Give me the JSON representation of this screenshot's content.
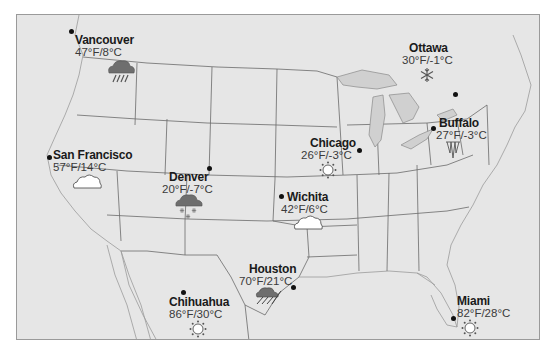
{
  "map": {
    "type": "weather-map",
    "region": "United States",
    "colors": {
      "land": "#e6e6e6",
      "water": "#d0d0d0",
      "border": "#6a6a6a",
      "text": "#1a1a1a",
      "temp_text": "#3a3a3a",
      "cloud_dark": "#6e6e6e",
      "cloud_light": "#ffffff"
    }
  },
  "cities": [
    {
      "name": "Vancouver",
      "temp": "47°F/8°C",
      "icon": "rain-cloud-icon",
      "condition": "rain"
    },
    {
      "name": "Ottawa",
      "temp": "30°F/-1°C",
      "icon": "snowflake-icon",
      "condition": "snow"
    },
    {
      "name": "Buffalo",
      "temp": "27°F/-3°C",
      "icon": "icicles-icon",
      "condition": "freezing"
    },
    {
      "name": "San Francisco",
      "temp": "57°F/14°C",
      "icon": "cloud-icon",
      "condition": "cloudy"
    },
    {
      "name": "Chicago",
      "temp": "26°F/-3°C",
      "icon": "sun-icon",
      "condition": "sunny"
    },
    {
      "name": "Denver",
      "temp": "20°F/-7°C",
      "icon": "snow-cloud-icon",
      "condition": "snow"
    },
    {
      "name": "Wichita",
      "temp": "42°F/6°C",
      "icon": "cloud-icon",
      "condition": "cloudy"
    },
    {
      "name": "Houston",
      "temp": "70°F/21°C",
      "icon": "thunderstorm-icon",
      "condition": "thunderstorm"
    },
    {
      "name": "Chihuahua",
      "temp": "86°F/30°C",
      "icon": "sun-icon",
      "condition": "sunny"
    },
    {
      "name": "Miami",
      "temp": "82°F/28°C",
      "icon": "sun-icon",
      "condition": "sunny"
    }
  ]
}
